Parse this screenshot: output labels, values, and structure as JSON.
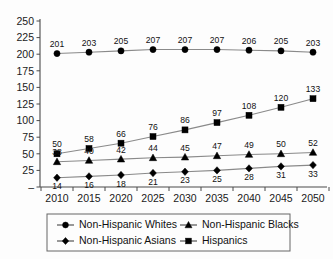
{
  "chart_data": {
    "type": "line",
    "title": "",
    "xlabel": "",
    "ylabel": "",
    "categories": [
      "2010",
      "2015",
      "2020",
      "2025",
      "2030",
      "2035",
      "2040",
      "2045",
      "2050"
    ],
    "ylim": [
      0,
      250
    ],
    "yticks": [
      "–",
      "25",
      "50",
      "75",
      "100",
      "125",
      "150",
      "175",
      "200",
      "225",
      "250"
    ],
    "ytick_values": [
      0,
      25,
      50,
      75,
      100,
      125,
      150,
      175,
      200,
      225,
      250
    ],
    "grid": false,
    "legend_position": "bottom",
    "series": [
      {
        "name": "Non-Hispanic Whites",
        "marker": "circle",
        "label_position": "above",
        "values": [
          201,
          203,
          205,
          207,
          207,
          207,
          206,
          205,
          203
        ]
      },
      {
        "name": "Non-Hispanic Blacks",
        "marker": "triangle",
        "label_position": "above",
        "values": [
          38,
          40,
          42,
          44,
          45,
          47,
          49,
          50,
          52
        ]
      },
      {
        "name": "Non-Hispanic Asians",
        "marker": "diamond",
        "label_position": "below",
        "values": [
          14,
          16,
          18,
          21,
          23,
          25,
          28,
          31,
          33
        ]
      },
      {
        "name": "Hispanics",
        "marker": "square",
        "label_position": "above",
        "values": [
          50,
          58,
          66,
          76,
          86,
          97,
          108,
          120,
          133
        ]
      }
    ]
  },
  "legend": {
    "entries": [
      {
        "label": "Non-Hispanic Whites",
        "marker": "circle"
      },
      {
        "label": "Non-Hispanic Blacks",
        "marker": "triangle"
      },
      {
        "label": "Non-Hispanic Asians",
        "marker": "diamond"
      },
      {
        "label": "Hispanics",
        "marker": "square"
      }
    ]
  },
  "colors": {
    "line": "#8a8a8a",
    "marker": "#000000",
    "axis": "#4a4a4a",
    "text": "#111111",
    "background": "#fdfdfd"
  }
}
